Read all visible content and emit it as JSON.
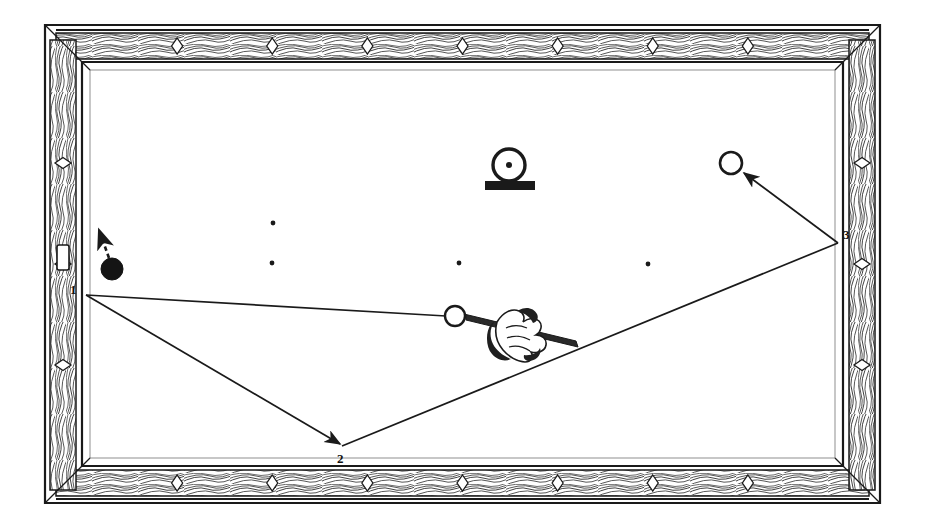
{
  "figure": {
    "kind": "billiards-diagram",
    "background_color": "#ffffff",
    "ink_color": "#1a1a1a",
    "width": 925,
    "height": 528
  },
  "table": {
    "frame": {
      "outer": {
        "x": 45,
        "y": 25,
        "width": 835,
        "height": 478
      },
      "rail_inner": {
        "x": 82,
        "y": 62,
        "width": 761,
        "height": 404
      },
      "wood_grain": true,
      "grain_color": "#2b2b2b"
    },
    "playing_surface": {
      "x": 82,
      "y": 62,
      "width": 761,
      "height": 404,
      "color": "#ffffff"
    },
    "diamonds": {
      "icon": "diamond-marker",
      "top_count": 7,
      "bottom_count": 7,
      "left_count": 3,
      "right_count": 3,
      "fill": "#ffffff",
      "stroke": "#1a1a1a"
    }
  },
  "balls": [
    {
      "id": "object-ball-black",
      "name": "black-ball",
      "cx": 112,
      "cy": 269,
      "r": 11,
      "fill": "#141414",
      "stroke": "#141414",
      "label": ""
    },
    {
      "id": "cue-ball",
      "name": "cue-ball",
      "cx": 455,
      "cy": 316,
      "r": 10,
      "fill": "#ffffff",
      "stroke": "#1a1a1a",
      "label": ""
    },
    {
      "id": "target-ball",
      "name": "target-ball",
      "cx": 731,
      "cy": 163,
      "r": 11,
      "fill": "#ffffff",
      "stroke": "#1a1a1a",
      "label": ""
    }
  ],
  "spots": [
    {
      "cx": 273,
      "cy": 223,
      "r": 2.4
    },
    {
      "cx": 272,
      "cy": 263,
      "r": 2.4
    },
    {
      "cx": 459,
      "cy": 263,
      "r": 2.4
    },
    {
      "cx": 648,
      "cy": 264,
      "r": 2.4
    }
  ],
  "cue": {
    "name": "cue-stick-and-hand",
    "tip": {
      "x": 466,
      "y": 316
    },
    "butt": {
      "x": 570,
      "y": 345
    },
    "hand_icon": "bridge-hand-icon"
  },
  "ball_stand": {
    "name": "ball-on-stand-marker",
    "cx": 509,
    "cy": 165,
    "r": 16,
    "center_dot_r": 3,
    "base": {
      "x": 485,
      "y": 181,
      "width": 50,
      "height": 9
    }
  },
  "trajectory": {
    "name": "cue-ball-path",
    "stroke": "#1a1a1a",
    "stroke_width": 1.6,
    "points": [
      {
        "x": 455,
        "y": 316,
        "label": "",
        "note": "cue ball start"
      },
      {
        "x": 86,
        "y": 295,
        "label": "1",
        "note": "first cushion (left rail)"
      },
      {
        "x": 342,
        "y": 446,
        "label": "2",
        "note": "second cushion (bottom rail)"
      },
      {
        "x": 838,
        "y": 243,
        "label": "3",
        "note": "third cushion (right rail)"
      },
      {
        "x": 742,
        "y": 172,
        "label": "",
        "note": "contacts target ball"
      }
    ],
    "arrowheads_at": [
      "2",
      "3-to-target"
    ]
  },
  "secondary_path": {
    "name": "black-ball-path",
    "style": "dashed",
    "from": {
      "x": 109,
      "y": 258
    },
    "to": {
      "x": 99,
      "y": 228
    },
    "arrowhead": true
  },
  "labels": [
    {
      "id": "label-1",
      "text": "1",
      "x": 73,
      "y": 290,
      "name": "cushion-label-1"
    },
    {
      "id": "label-2",
      "text": "2",
      "x": 339,
      "y": 458,
      "name": "cushion-label-2"
    },
    {
      "id": "label-3",
      "text": "3",
      "x": 845,
      "y": 235,
      "name": "cushion-label-3"
    }
  ],
  "chart_data": {
    "type": "diagram",
    "cushion_sequence": [
      "1",
      "2",
      "3"
    ],
    "table_aspect": "2:1",
    "ball_count": 3
  }
}
